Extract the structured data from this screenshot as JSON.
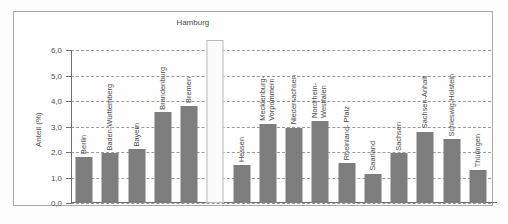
{
  "chart_data": {
    "type": "bar",
    "title": "",
    "xlabel": "",
    "ylabel": "Anteil (%)",
    "ylim": [
      0,
      6
    ],
    "ytick_labels": [
      "0,0",
      "1,0",
      "2,0",
      "3,0",
      "4,0",
      "5,0",
      "6,0"
    ],
    "ytick_values": [
      0,
      1,
      2,
      3,
      4,
      5,
      6
    ],
    "grid": true,
    "legend": "none",
    "annotations": [
      {
        "text": "Hamburg",
        "note": "callout above off-scale light bar"
      }
    ],
    "categories": [
      "Berlin",
      "Baden-Württemberg",
      "Bayern",
      "Brandenburg",
      "Bremen",
      "Hamburg",
      "Hessen",
      "Mecklenburg-Vorpommern",
      "Niedersachsen",
      "Nordrhein-Westfalen",
      "Rheinland-Pfalz",
      "Saarland",
      "Sachsen",
      "Sachsen-Anhalt",
      "Schleswig-Holstein",
      "Thüringen"
    ],
    "values": [
      1.8,
      1.95,
      2.1,
      3.55,
      3.8,
      6.0,
      1.5,
      3.1,
      2.95,
      3.2,
      1.55,
      1.15,
      1.95,
      2.8,
      2.5,
      1.3
    ],
    "bars": [
      {
        "label": "Berlin",
        "label_lines": [
          "Berlin"
        ],
        "value": 1.8,
        "highlight": false,
        "label_inside": true
      },
      {
        "label": "Baden-Württemberg",
        "label_lines": [
          "Baden-Württemberg"
        ],
        "value": 1.95,
        "highlight": false,
        "label_inside": false
      },
      {
        "label": "Bayern",
        "label_lines": [
          "Bayern"
        ],
        "value": 2.1,
        "highlight": false,
        "label_inside": false
      },
      {
        "label": "Brandenburg",
        "label_lines": [
          "Brandenburg"
        ],
        "value": 3.55,
        "highlight": false,
        "label_inside": false
      },
      {
        "label": "Bremen",
        "label_lines": [
          "Bremen"
        ],
        "value": 3.8,
        "highlight": false,
        "label_inside": false
      },
      {
        "label": "Hamburg",
        "label_lines": [
          "Hamburg"
        ],
        "value": 6.0,
        "highlight": true,
        "label_inside": false
      },
      {
        "label": "Hessen",
        "label_lines": [
          "Hessen"
        ],
        "value": 1.5,
        "highlight": false,
        "label_inside": false
      },
      {
        "label": "Mecklenburg-Vorpommern",
        "label_lines": [
          "Mecklenburg-",
          "Vorpommern"
        ],
        "value": 3.1,
        "highlight": false,
        "label_inside": false
      },
      {
        "label": "Niedersachsen",
        "label_lines": [
          "Niedersachsen"
        ],
        "value": 2.95,
        "highlight": false,
        "label_inside": false
      },
      {
        "label": "Nordrhein-Westfalen",
        "label_lines": [
          "Nordrhein-",
          "Westfalen"
        ],
        "value": 3.2,
        "highlight": false,
        "label_inside": false
      },
      {
        "label": "Rheinland-Pfalz",
        "label_lines": [
          "Rheinland- Pfalz"
        ],
        "value": 1.55,
        "highlight": false,
        "label_inside": false
      },
      {
        "label": "Saarland",
        "label_lines": [
          "Saarland"
        ],
        "value": 1.15,
        "highlight": false,
        "label_inside": false
      },
      {
        "label": "Sachsen",
        "label_lines": [
          "Sachsen"
        ],
        "value": 1.95,
        "highlight": false,
        "label_inside": false
      },
      {
        "label": "Sachsen-Anhalt",
        "label_lines": [
          "Sachsen-Anhalt"
        ],
        "value": 2.8,
        "highlight": false,
        "label_inside": false
      },
      {
        "label": "Schleswig-Holstein",
        "label_lines": [
          "Schleswig-Holstein"
        ],
        "value": 2.5,
        "highlight": false,
        "label_inside": false
      },
      {
        "label": "Thüringen",
        "label_lines": [
          "Thüringen"
        ],
        "value": 1.3,
        "highlight": false,
        "label_inside": false
      }
    ],
    "colors": {
      "bar": "#7d7d7d",
      "bar_highlight": "#fbfbfb",
      "grid": "#9a9a9a",
      "axis": "#6f6f6f",
      "text": "#4a4a4a",
      "frame": "#a8a8a8",
      "background": "#fefefe"
    }
  }
}
